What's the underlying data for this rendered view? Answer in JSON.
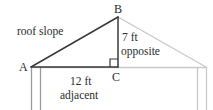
{
  "figure": {
    "background_color": "#ffffff",
    "primary_stroke_color": "#3a3a3a",
    "secondary_stroke_color": "#c9c9c9",
    "text_color": "#2b2b2b",
    "vertices": {
      "A": {
        "label": "A",
        "x": 31,
        "y": 67
      },
      "B": {
        "label": "B",
        "x": 118,
        "y": 17
      },
      "C": {
        "label": "C",
        "x": 118,
        "y": 67
      }
    },
    "labels": {
      "roof_slope": "roof slope",
      "opposite_length": "7 ft",
      "opposite_name": "opposite",
      "adjacent_length": "12 ft",
      "adjacent_name": "adjacent"
    },
    "right_angle_at": "C",
    "house_outline": {
      "roof_right_end_x": 206,
      "baseline_left_x": 31,
      "baseline_right_x": 207,
      "baseline_y": 67,
      "wall_xs": [
        31,
        40,
        197,
        206
      ],
      "wall_bottom_y": 110
    }
  }
}
